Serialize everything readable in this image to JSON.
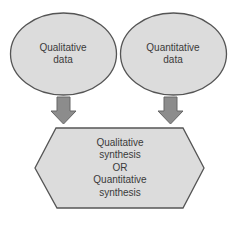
{
  "diagram": {
    "nodes": [
      {
        "id": "qualitative-data",
        "shape": "ellipse",
        "lines": [
          "Qualitative",
          "data"
        ]
      },
      {
        "id": "quantitative-data",
        "shape": "ellipse",
        "lines": [
          "Quantitative",
          "data"
        ]
      },
      {
        "id": "synthesis",
        "shape": "hexagon",
        "lines": [
          "Qualitative",
          "synthesis",
          "OR",
          "Quantitative",
          "synthesis"
        ]
      }
    ],
    "edges": [
      {
        "from": "qualitative-data",
        "to": "synthesis",
        "style": "block-arrow"
      },
      {
        "from": "quantitative-data",
        "to": "synthesis",
        "style": "block-arrow"
      }
    ],
    "colors": {
      "fill": "#dcdcdc",
      "stroke": "#555555",
      "arrow_fill": "#8c8c8c",
      "arrow_stroke": "#666666",
      "text": "#3a3a3a",
      "background": "#ffffff"
    }
  }
}
